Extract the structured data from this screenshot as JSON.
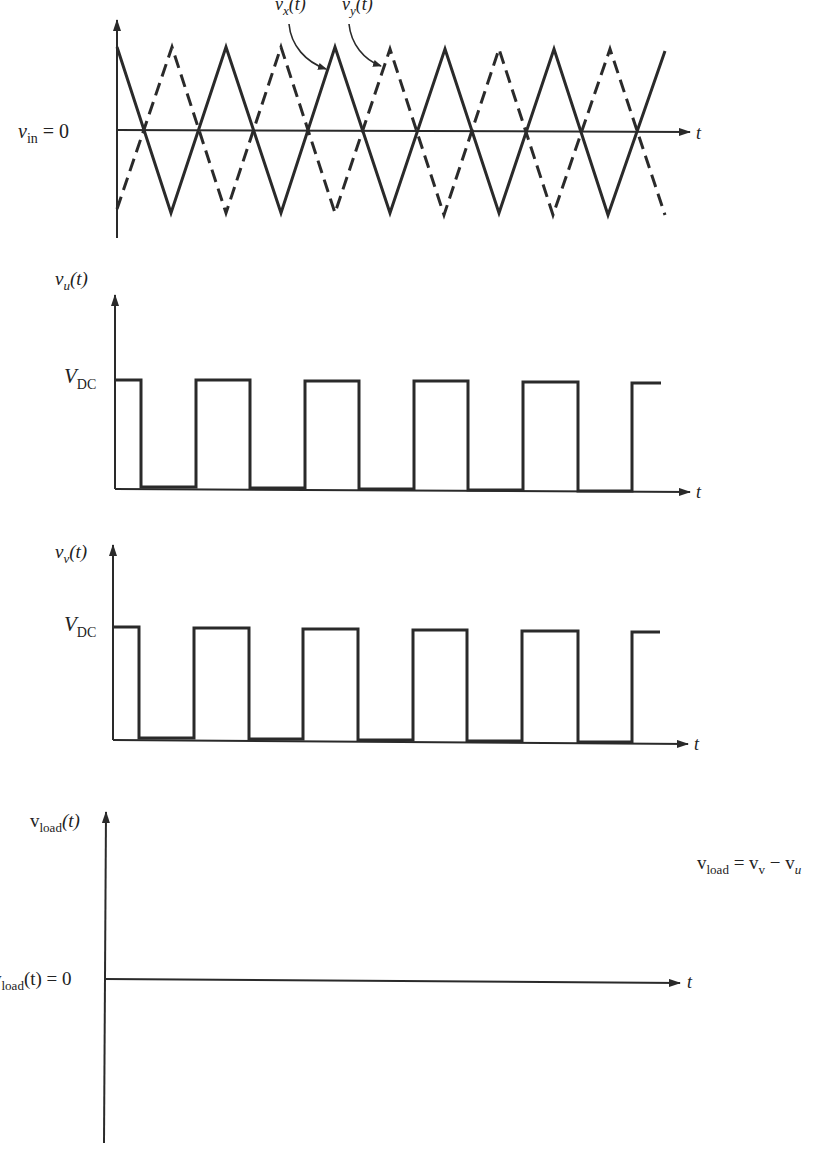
{
  "figure": {
    "stroke_color": "#2a2a2a",
    "plots": [
      {
        "id": "carrier",
        "y_label": "v_in = 0",
        "y_label_var": "v",
        "y_label_sub": "in",
        "y_label_rest": " = 0",
        "x_label": "t",
        "series": [
          {
            "name": "v_x(t)",
            "label_var": "v",
            "label_sub": "x",
            "label_rest": "(t)",
            "style": "solid",
            "shape": "triangle",
            "starts_at": "peak"
          },
          {
            "name": "v_y(t)",
            "label_var": "v",
            "label_sub": "y",
            "label_rest": "(t)",
            "style": "dashed",
            "shape": "triangle",
            "starts_at": "trough"
          }
        ]
      },
      {
        "id": "vu",
        "y_label_var": "v",
        "y_label_sub": "u",
        "y_label_rest": "(t)",
        "level_label_var": "V",
        "level_label_sub": "DC",
        "x_label": "t"
      },
      {
        "id": "vv",
        "y_label_var": "v",
        "y_label_sub": "v",
        "y_label_rest": "(t)",
        "level_label_var": "V",
        "level_label_sub": "DC",
        "x_label": "t"
      },
      {
        "id": "vload",
        "y_label_var": "v",
        "y_label_sub": "load",
        "y_label_rest": "(t)",
        "zero_label_var": "v",
        "zero_label_sub": "load",
        "zero_label_rest": "(t) = 0",
        "x_label": "t",
        "equation": {
          "lhs_var": "v",
          "lhs_sub": "load",
          "eq": " = ",
          "t1_var": "v",
          "t1_sub": "v",
          "minus": " − ",
          "t2_var": "v",
          "t2_sub": "u"
        }
      }
    ]
  }
}
